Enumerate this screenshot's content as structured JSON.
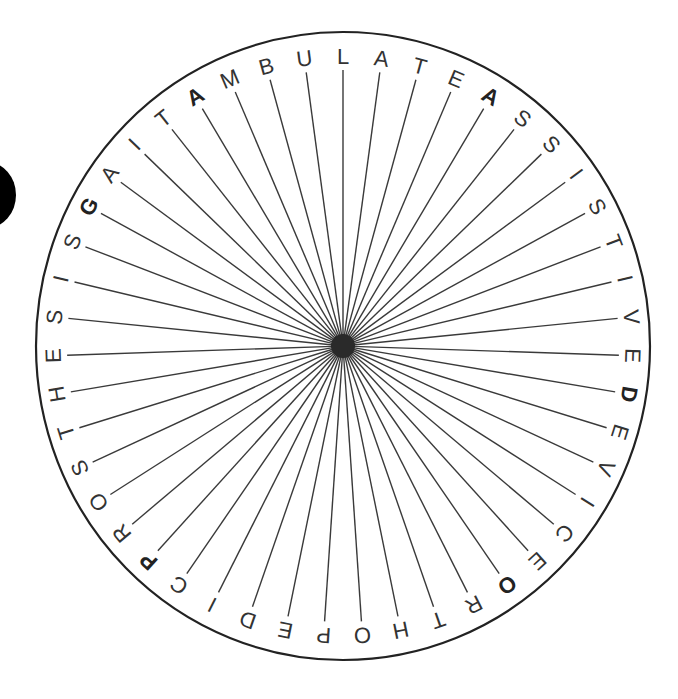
{
  "puzzle": {
    "type": "word-wheel",
    "start_letter_at_top": "L",
    "letters_clockwise_from_top": [
      "L",
      "A",
      "T",
      "E",
      "A",
      "S",
      "S",
      "I",
      "S",
      "T",
      "I",
      "V",
      "E",
      "D",
      "E",
      "V",
      "I",
      "C",
      "E",
      "O",
      "R",
      "T",
      "H",
      "O",
      "P",
      "E",
      "D",
      "I",
      "C",
      "P",
      "R",
      "O",
      "S",
      "T",
      "H",
      "E",
      "S",
      "I",
      "S",
      "G",
      "A",
      "I",
      "T",
      "A",
      "M",
      "B",
      "U"
    ],
    "bold_indices": [
      4,
      13,
      19,
      29,
      39,
      43
    ],
    "words": [
      "AMBULATE",
      "ASSISTIVE",
      "DEVICE",
      "ORTHOPEDIC",
      "PROSTHESIS",
      "GAIT"
    ]
  },
  "geometry": {
    "cx": 343,
    "cy": 346,
    "rx": 307,
    "ry": 314,
    "line_inner": 0,
    "line_outer": 276,
    "letter_radius": 290,
    "center_dot_radius": 12
  },
  "colors": {
    "circle": "#222222",
    "lines": "#3a3a3a",
    "letters": "#333333",
    "center_dot": "#2a2a2a",
    "blob": "#000000"
  }
}
